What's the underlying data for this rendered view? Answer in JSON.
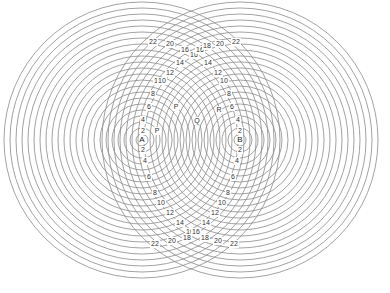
{
  "diagram": {
    "title": "",
    "width": 390,
    "height": 293,
    "line_color": "#8a8a8a",
    "text_color": "#333333",
    "sources": [
      {
        "id": "A",
        "label": "A",
        "cx": 142,
        "cy": 140
      },
      {
        "id": "B",
        "label": "B",
        "cx": 240,
        "cy": 140
      }
    ],
    "ring_spacing": 6,
    "ring_count": 23,
    "center_labels": [
      {
        "text": "P",
        "x": 176,
        "y": 107
      },
      {
        "text": "Q",
        "x": 197,
        "y": 121
      },
      {
        "text": "R",
        "x": 219,
        "y": 110
      },
      {
        "text": "P",
        "x": 157,
        "y": 131
      }
    ],
    "left_arc_labels": [
      {
        "text": "2",
        "x": 143,
        "y": 131
      },
      {
        "text": "4",
        "x": 143,
        "y": 120
      },
      {
        "text": "6",
        "x": 149,
        "y": 107
      },
      {
        "text": "8",
        "x": 153,
        "y": 94
      },
      {
        "text": "10",
        "x": 158,
        "y": 81
      },
      {
        "text": "10",
        "x": 162,
        "y": 81
      },
      {
        "text": "12",
        "x": 170,
        "y": 73
      },
      {
        "text": "14",
        "x": 180,
        "y": 63
      },
      {
        "text": "16",
        "x": 185,
        "y": 50
      },
      {
        "text": "16",
        "x": 194,
        "y": 55
      },
      {
        "text": "20",
        "x": 170,
        "y": 44
      },
      {
        "text": "22",
        "x": 153,
        "y": 42
      },
      {
        "text": "2",
        "x": 143,
        "y": 150
      },
      {
        "text": "4",
        "x": 145,
        "y": 161
      },
      {
        "text": "6",
        "x": 149,
        "y": 177
      },
      {
        "text": "8",
        "x": 155,
        "y": 193
      },
      {
        "text": "10",
        "x": 161,
        "y": 203
      },
      {
        "text": "12",
        "x": 170,
        "y": 213
      },
      {
        "text": "14",
        "x": 180,
        "y": 223
      },
      {
        "text": "16",
        "x": 190,
        "y": 232
      },
      {
        "text": "18",
        "x": 187,
        "y": 238
      },
      {
        "text": "20",
        "x": 172,
        "y": 241
      },
      {
        "text": "22",
        "x": 155,
        "y": 244
      }
    ],
    "right_arc_labels": [
      {
        "text": "2",
        "x": 240,
        "y": 131
      },
      {
        "text": "4",
        "x": 238,
        "y": 120
      },
      {
        "text": "6",
        "x": 232,
        "y": 107
      },
      {
        "text": "8",
        "x": 229,
        "y": 94
      },
      {
        "text": "10",
        "x": 224,
        "y": 81
      },
      {
        "text": "12",
        "x": 218,
        "y": 73
      },
      {
        "text": "14",
        "x": 208,
        "y": 63
      },
      {
        "text": "16",
        "x": 200,
        "y": 50
      },
      {
        "text": "18",
        "x": 207,
        "y": 46
      },
      {
        "text": "20",
        "x": 220,
        "y": 44
      },
      {
        "text": "22",
        "x": 236,
        "y": 42
      },
      {
        "text": "2",
        "x": 240,
        "y": 150
      },
      {
        "text": "4",
        "x": 237,
        "y": 161
      },
      {
        "text": "6",
        "x": 233,
        "y": 177
      },
      {
        "text": "8",
        "x": 228,
        "y": 193
      },
      {
        "text": "10",
        "x": 222,
        "y": 203
      },
      {
        "text": "12",
        "x": 215,
        "y": 213
      },
      {
        "text": "14",
        "x": 206,
        "y": 223
      },
      {
        "text": "16",
        "x": 196,
        "y": 232
      },
      {
        "text": "18",
        "x": 205,
        "y": 238
      },
      {
        "text": "20",
        "x": 218,
        "y": 241
      },
      {
        "text": "22",
        "x": 234,
        "y": 244
      }
    ]
  }
}
